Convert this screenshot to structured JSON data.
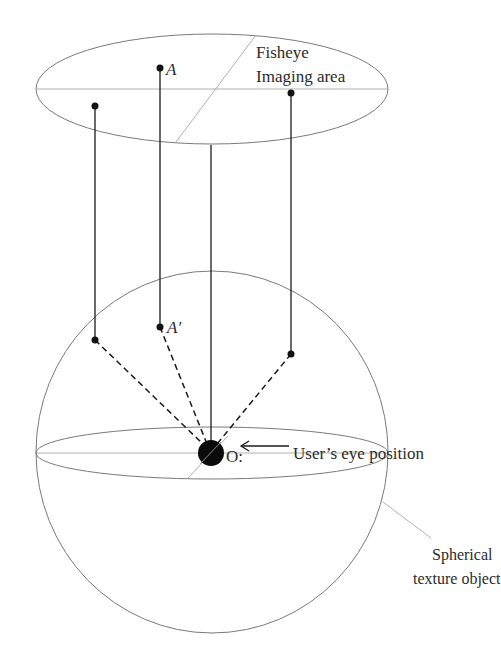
{
  "diagram": {
    "title_label_line1": "Fisheye",
    "title_label_line2": "Imaging area",
    "point_a_label": "A",
    "point_a_prime_label": "A′",
    "origin_label": "O:",
    "eye_position_label": "User’s eye position",
    "sphere_label_line1": "Spherical",
    "sphere_label_line2": "texture object"
  },
  "shapes": {
    "imaging_ellipse": {
      "cx": 212,
      "cy": 89,
      "rx": 176,
      "ry": 55
    },
    "sphere": {
      "cx": 212,
      "cy": 452,
      "rx": 176,
      "ry": 181
    },
    "equator": {
      "cx": 212,
      "cy": 453,
      "rx": 176,
      "ry": 26
    },
    "origin": {
      "cx": 211,
      "cy": 453,
      "r": 13
    },
    "imaging_points": [
      {
        "name": "left",
        "x": 95,
        "y": 106
      },
      {
        "name": "A",
        "x": 160,
        "y": 68
      },
      {
        "name": "right",
        "x": 291,
        "y": 93
      }
    ],
    "sphere_points": [
      {
        "name": "left",
        "x": 95,
        "y": 340
      },
      {
        "name": "A_prime",
        "x": 160,
        "y": 327
      },
      {
        "name": "right",
        "x": 291,
        "y": 354
      }
    ]
  }
}
